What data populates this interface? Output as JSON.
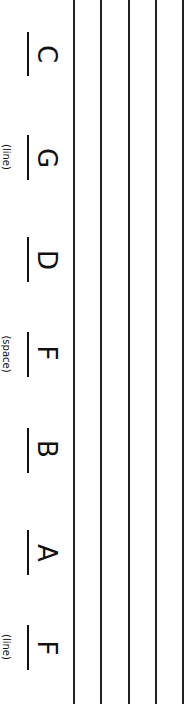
{
  "worksheet": {
    "staff_line_count": 5,
    "notes": [
      {
        "letter": "C",
        "hint": ""
      },
      {
        "letter": "G",
        "hint": "(line)"
      },
      {
        "letter": "D",
        "hint": ""
      },
      {
        "letter": "F",
        "hint": "(space)"
      },
      {
        "letter": "B",
        "hint": ""
      },
      {
        "letter": "A",
        "hint": ""
      },
      {
        "letter": "F",
        "hint": "(line)"
      }
    ]
  }
}
